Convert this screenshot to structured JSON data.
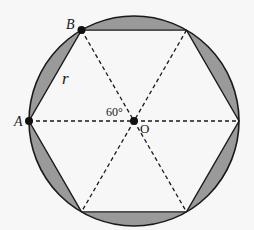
{
  "diagram": {
    "type": "regular hexagon inscribed in circle",
    "center": {
      "x": 134,
      "y": 121
    },
    "radius": 105,
    "colors": {
      "background": "#f7f7f7",
      "segment_fill": "#9a9a9a",
      "stroke": "#1a1a1a"
    },
    "labels": {
      "vertex_a": "A",
      "vertex_b": "B",
      "center": "O",
      "radius": "r",
      "angle": "60°"
    }
  }
}
